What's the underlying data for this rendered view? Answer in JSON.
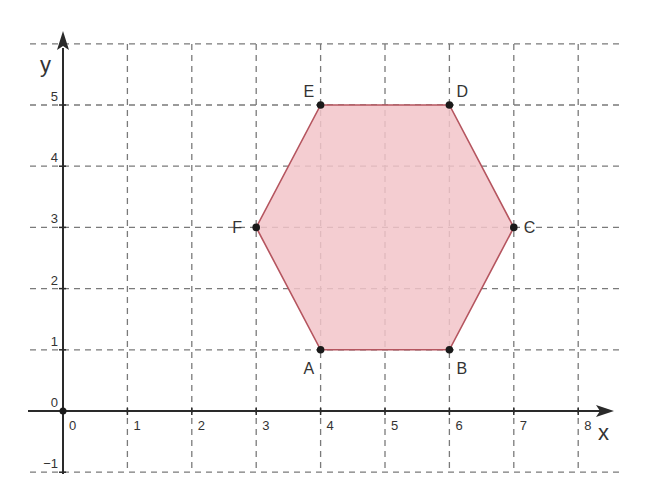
{
  "chart_data": {
    "type": "scatter",
    "title": "",
    "xlabel": "x",
    "ylabel": "y",
    "xlim": [
      -0.5,
      8.7
    ],
    "ylim": [
      -1,
      6
    ],
    "grid": true,
    "grid_style": "dashed",
    "x_ticks": [
      0,
      1,
      2,
      3,
      4,
      5,
      6,
      7,
      8
    ],
    "y_ticks": [
      -1,
      0,
      1,
      2,
      3,
      4,
      5
    ],
    "origin_label": "0",
    "shape": {
      "type": "polygon",
      "name": "hexagon ABCDEF",
      "fill": "#f2c4c9",
      "stroke": "#b5555f",
      "vertices": [
        {
          "label": "A",
          "x": 4,
          "y": 1
        },
        {
          "label": "B",
          "x": 6,
          "y": 1
        },
        {
          "label": "C",
          "x": 7,
          "y": 3
        },
        {
          "label": "D",
          "x": 6,
          "y": 5
        },
        {
          "label": "E",
          "x": 4,
          "y": 5
        },
        {
          "label": "F",
          "x": 3,
          "y": 3
        }
      ]
    }
  },
  "axes": {
    "x_name": "x",
    "y_name": "y",
    "x_tick_labels": [
      "0",
      "1",
      "2",
      "3",
      "4",
      "5",
      "6",
      "7",
      "8"
    ],
    "y_tick_labels": [
      "−1",
      "0",
      "1",
      "2",
      "3",
      "4",
      "5"
    ]
  },
  "colors": {
    "grid": "#7a7a7a",
    "axis": "#2a2a2a",
    "polygon_fill": "#f2c4c9",
    "polygon_stroke": "#b5555f",
    "point": "#1a1a1a"
  }
}
